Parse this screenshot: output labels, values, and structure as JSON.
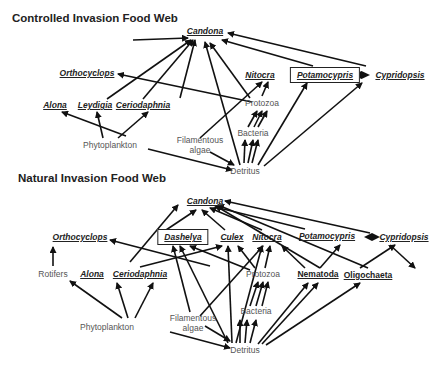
{
  "diagrams": [
    {
      "id": "controlled",
      "title": "Controlled Invasion Food Web",
      "title_pos": [
        12,
        18
      ],
      "nodes": [
        {
          "id": "candona",
          "label": "Candona",
          "x": 205,
          "y": 31,
          "style": "taxon"
        },
        {
          "id": "orthocyclops",
          "label": "Orthocyclops",
          "x": 87,
          "y": 73,
          "style": "taxon"
        },
        {
          "id": "nitocra",
          "label": "Nitocra",
          "x": 260,
          "y": 75,
          "style": "taxon"
        },
        {
          "id": "potamocypris",
          "label": "Potamocypris",
          "x": 325,
          "y": 75,
          "style": "taxon boxed"
        },
        {
          "id": "cypridopsis",
          "label": "Cypridopsis",
          "x": 400,
          "y": 75,
          "style": "taxon"
        },
        {
          "id": "alona",
          "label": "Alona",
          "x": 55,
          "y": 105,
          "style": "taxon"
        },
        {
          "id": "leydigia",
          "label": "Leydigia",
          "x": 95,
          "y": 105,
          "style": "taxon"
        },
        {
          "id": "ceriodaphnia",
          "label": "Ceriodaphnia",
          "x": 143,
          "y": 105,
          "style": "taxon"
        },
        {
          "id": "protozoa",
          "label": "Protozoa",
          "x": 262,
          "y": 103,
          "style": "plain"
        },
        {
          "id": "bacteria",
          "label": "Bacteria",
          "x": 253,
          "y": 133,
          "style": "plain"
        },
        {
          "id": "filamentous",
          "label": "Filamentous\nalgae",
          "x": 200,
          "y": 145,
          "style": "plain"
        },
        {
          "id": "phytoplankton",
          "label": "Phytoplankton",
          "x": 110,
          "y": 145,
          "style": "plain"
        },
        {
          "id": "detritus",
          "label": "Detritus",
          "x": 245,
          "y": 171,
          "style": "plain"
        }
      ],
      "edges": [
        [
          "alona",
          "candona",
          [
            133,
            40
          ],
          [
            188,
            38
          ]
        ],
        [
          "leydigia",
          "candona",
          [
            107,
            99
          ],
          [
            191,
            40
          ]
        ],
        [
          "ceriodaphnia",
          "candona",
          [
            143,
            99
          ],
          [
            193,
            40
          ]
        ],
        [
          "phytoplankton",
          "candona",
          [
            180,
            98
          ],
          [
            195,
            40
          ]
        ],
        [
          "detritus",
          "candona",
          [
            240,
            165
          ],
          [
            205,
            42
          ]
        ],
        [
          "protozoa",
          "candona",
          [
            250,
            98
          ],
          [
            210,
            43
          ]
        ],
        [
          "protozoa",
          "orthocyclops",
          [
            252,
            102
          ],
          [
            118,
            74
          ]
        ],
        [
          "potamocypris",
          "candona",
          [
            313,
            66
          ],
          [
            222,
            40
          ]
        ],
        [
          "cypridopsis",
          "candona",
          [
            366,
            66
          ],
          [
            228,
            33
          ]
        ],
        [
          "phytoplankton",
          "alona",
          [
            126,
            136
          ],
          [
            62,
            112
          ]
        ],
        [
          "phytoplankton",
          "leydigia",
          [
            103,
            138
          ],
          [
            97,
            112
          ]
        ],
        [
          "phytoplankton",
          "ceriodaphnia",
          [
            118,
            138
          ],
          [
            148,
            112
          ]
        ],
        [
          "filamentous",
          "nitocra",
          [
            200,
            138
          ],
          [
            262,
            82
          ]
        ],
        [
          "protozoa",
          "nitocra",
          [
            262,
            96
          ],
          [
            268,
            82
          ]
        ],
        [
          "bacteria",
          "protozoa",
          [
            248,
            127
          ],
          [
            257,
            111
          ]
        ],
        [
          "bacteria",
          "protozoa",
          [
            254,
            127
          ],
          [
            262,
            111
          ]
        ],
        [
          "bacteria",
          "protozoa",
          [
            258,
            127
          ],
          [
            267,
            111
          ]
        ],
        [
          "detritus",
          "bacteria",
          [
            244,
            163
          ],
          [
            245,
            140
          ]
        ],
        [
          "detritus",
          "bacteria",
          [
            248,
            163
          ],
          [
            253,
            140
          ]
        ],
        [
          "detritus",
          "bacteria",
          [
            252,
            163
          ],
          [
            258,
            140
          ]
        ],
        [
          "phytoplankton",
          "detritus",
          [
            148,
            149
          ],
          [
            232,
            170
          ]
        ],
        [
          "filamentous",
          "detritus",
          [
            210,
            152
          ],
          [
            234,
            165
          ]
        ],
        [
          "detritus",
          "potamocypris",
          [
            258,
            165
          ],
          [
            307,
            83
          ]
        ],
        [
          "detritus",
          "cypridopsis",
          [
            264,
            166
          ],
          [
            362,
            83
          ]
        ]
      ],
      "double_edges": [
        [
          [
            353,
            75
          ],
          [
            370,
            75
          ]
        ]
      ]
    },
    {
      "id": "natural",
      "title": "Natural Invasion Food Web",
      "title_pos": [
        18,
        178
      ],
      "nodes": [
        {
          "id": "candona",
          "label": "Candona",
          "x": 205,
          "y": 201,
          "style": "taxon"
        },
        {
          "id": "orthocyclops",
          "label": "Orthocyclops",
          "x": 80,
          "y": 237,
          "style": "taxon"
        },
        {
          "id": "dashelya",
          "label": "Dashelya",
          "x": 183,
          "y": 237,
          "style": "taxon boxed"
        },
        {
          "id": "culex",
          "label": "Culex",
          "x": 232,
          "y": 237,
          "style": "taxon"
        },
        {
          "id": "nitocra",
          "label": "Nitocra",
          "x": 267,
          "y": 237,
          "style": "taxon"
        },
        {
          "id": "potamocypris",
          "label": "Potamocypris",
          "x": 327,
          "y": 236,
          "style": "taxon"
        },
        {
          "id": "cypridopsis",
          "label": "Cypridopsis",
          "x": 404,
          "y": 237,
          "style": "taxon"
        },
        {
          "id": "rotifers",
          "label": "Rotifers",
          "x": 53,
          "y": 274,
          "style": "plain"
        },
        {
          "id": "alona",
          "label": "Alona",
          "x": 92,
          "y": 274,
          "style": "taxon"
        },
        {
          "id": "ceriodaphnia",
          "label": "Ceriodaphnia",
          "x": 140,
          "y": 274,
          "style": "taxon"
        },
        {
          "id": "protozoa",
          "label": "Protozoa",
          "x": 263,
          "y": 274,
          "style": "plain"
        },
        {
          "id": "nematoda",
          "label": "Nematoda",
          "x": 318,
          "y": 274,
          "style": "group-bold"
        },
        {
          "id": "oligochaeta",
          "label": "Oligochaeta",
          "x": 368,
          "y": 275,
          "style": "group-bold"
        },
        {
          "id": "bacteria",
          "label": "Bacteria",
          "x": 256,
          "y": 311,
          "style": "plain"
        },
        {
          "id": "filamentous",
          "label": "Filamentous\nalgae",
          "x": 193,
          "y": 323,
          "style": "plain"
        },
        {
          "id": "phytoplankton",
          "label": "Phytoplankton",
          "x": 107,
          "y": 327,
          "style": "plain"
        },
        {
          "id": "detritus",
          "label": "Detritus",
          "x": 245,
          "y": 350,
          "style": "plain"
        }
      ],
      "edges": [
        [
          "orthocyclops_src",
          "candona",
          [
            130,
            262
          ],
          [
            178,
            205
          ]
        ],
        [
          "dashelya",
          "candona",
          [
            166,
            230
          ],
          [
            196,
            210
          ]
        ],
        [
          "culex",
          "candona",
          [
            225,
            230
          ],
          [
            202,
            210
          ]
        ],
        [
          "nitocra",
          "candona",
          [
            262,
            230
          ],
          [
            210,
            208
          ]
        ],
        [
          "potamocypris",
          "candona",
          [
            305,
            229
          ],
          [
            215,
            207
          ]
        ],
        [
          "nematoda",
          "candona",
          [
            320,
            268
          ],
          [
            216,
            206
          ]
        ],
        [
          "oligochaeta",
          "candona",
          [
            368,
            268
          ],
          [
            218,
            205
          ]
        ],
        [
          "cypridopsis",
          "candona",
          [
            370,
            233
          ],
          [
            225,
            201
          ]
        ],
        [
          "phytoplankton",
          "orthocyclops",
          [
            210,
            266
          ],
          [
            110,
            240
          ]
        ],
        [
          "rotifers",
          "orthocyclops_up",
          [
            53,
            266
          ],
          [
            53,
            247
          ]
        ],
        [
          "protozoa",
          "dashelya",
          [
            250,
            270
          ],
          [
            190,
            246
          ]
        ],
        [
          "filamentous",
          "dashelya",
          [
            190,
            312
          ],
          [
            173,
            246
          ]
        ],
        [
          "detritus",
          "dashelya",
          [
            228,
            343
          ],
          [
            180,
            246
          ]
        ],
        [
          "detritus",
          "culex",
          [
            232,
            343
          ],
          [
            228,
            246
          ]
        ],
        [
          "protozoa",
          "culex",
          [
            255,
            268
          ],
          [
            238,
            246
          ]
        ],
        [
          "ceriodaphnia",
          "culex",
          [
            140,
            267
          ],
          [
            222,
            246
          ]
        ],
        [
          "detritus",
          "nitocra",
          [
            236,
            343
          ],
          [
            262,
            246
          ]
        ],
        [
          "protozoa",
          "nitocra",
          [
            265,
            268
          ],
          [
            270,
            246
          ]
        ],
        [
          "filamentous",
          "nitocra",
          [
            200,
            316
          ],
          [
            263,
            246
          ]
        ],
        [
          "nematoda",
          "nitocra",
          [
            305,
            268
          ],
          [
            282,
            246
          ]
        ],
        [
          "nematoda",
          "potamocypris",
          [
            320,
            268
          ],
          [
            340,
            245
          ]
        ],
        [
          "oligochaeta",
          "cypridopsis",
          [
            360,
            268
          ],
          [
            395,
            245
          ]
        ],
        [
          "cypridopsis_line",
          "oligochaeta",
          [
            390,
            245
          ],
          [
            415,
            268
          ]
        ],
        [
          "phytoplankton",
          "rotifers",
          [
            122,
            318
          ],
          [
            70,
            281
          ]
        ],
        [
          "phytoplankton",
          "alona",
          [
            128,
            318
          ],
          [
            117,
            283
          ]
        ],
        [
          "phytoplankton",
          "ceriodaphnia",
          [
            135,
            318
          ],
          [
            153,
            283
          ]
        ],
        [
          "bacteria",
          "protozoa",
          [
            250,
            306
          ],
          [
            258,
            282
          ]
        ],
        [
          "bacteria",
          "protozoa",
          [
            256,
            306
          ],
          [
            263,
            282
          ]
        ],
        [
          "bacteria",
          "protozoa",
          [
            262,
            306
          ],
          [
            268,
            282
          ]
        ],
        [
          "detritus",
          "bacteria",
          [
            240,
            343
          ],
          [
            240,
            320
          ]
        ],
        [
          "detritus",
          "bacteria",
          [
            245,
            343
          ],
          [
            247,
            320
          ]
        ],
        [
          "detritus",
          "bacteria",
          [
            250,
            343
          ],
          [
            256,
            320
          ]
        ],
        [
          "phytoplankton",
          "detritus",
          [
            170,
            332
          ],
          [
            230,
            348
          ]
        ],
        [
          "filamentous",
          "detritus",
          [
            205,
            326
          ],
          [
            230,
            341
          ]
        ],
        [
          "detritus",
          "nematoda",
          [
            258,
            344
          ],
          [
            308,
            283
          ]
        ],
        [
          "detritus",
          "nematoda",
          [
            262,
            344
          ],
          [
            318,
            283
          ]
        ],
        [
          "detritus",
          "oligochaeta",
          [
            266,
            345
          ],
          [
            360,
            283
          ]
        ]
      ],
      "double_edges": [
        [
          [
            364,
            237
          ],
          [
            380,
            237
          ]
        ]
      ]
    }
  ]
}
